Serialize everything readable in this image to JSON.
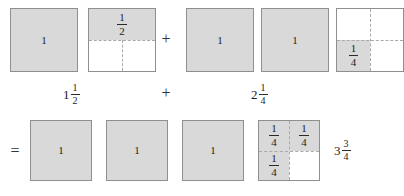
{
  "figure": {
    "colors": {
      "shaded": "#d9d9d9",
      "unshaded": "#ffffff",
      "border": "#8f8f8f",
      "dashed": "#a9a9a9",
      "text": "#1c1c1c"
    },
    "row1": {
      "squares": [
        {
          "name": "row1-square-1",
          "shading": "whole",
          "label": "1",
          "label_type": "whole"
        },
        {
          "name": "row1-square-2",
          "shading": "top-half",
          "label_num": "1",
          "label_den": "2",
          "label_type": "fraction"
        },
        {
          "name": "row1-square-3",
          "shading": "whole",
          "label": "1",
          "label_type": "whole"
        },
        {
          "name": "row1-square-4",
          "shading": "whole",
          "label": "1",
          "label_type": "whole"
        },
        {
          "name": "row1-square-5",
          "shading": "bottom-left-quarter",
          "label_num": "1",
          "label_den": "4",
          "label_type": "fraction"
        }
      ],
      "plus": "+"
    },
    "row_labels": {
      "left_whole": "1",
      "left_num": "1",
      "left_den": "2",
      "plus": "+",
      "right_whole": "2",
      "right_num": "1",
      "right_den": "4"
    },
    "row2": {
      "equals": "=",
      "squares": [
        {
          "name": "row2-square-1",
          "shading": "whole",
          "label": "1",
          "label_type": "whole"
        },
        {
          "name": "row2-square-2",
          "shading": "whole",
          "label": "1",
          "label_type": "whole"
        },
        {
          "name": "row2-square-3",
          "shading": "whole",
          "label": "1",
          "label_type": "whole"
        },
        {
          "name": "row2-square-4",
          "shading": "three-quarters",
          "quarter_num": "1",
          "quarter_den": "4",
          "label_type": "quarters"
        }
      ],
      "result_whole": "3",
      "result_num": "3",
      "result_den": "4"
    }
  }
}
